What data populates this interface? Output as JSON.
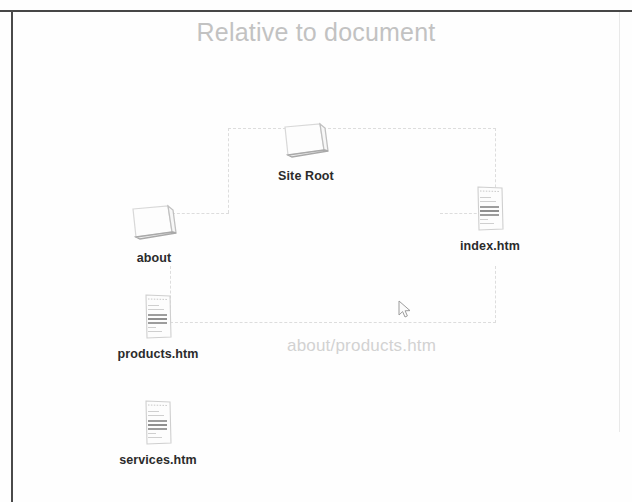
{
  "page": {
    "title": "Relative to document",
    "title_color": "#c2c2c2",
    "background": "#fefefe",
    "connector_color": "#dddddd",
    "label_color": "#2b2b2b"
  },
  "diagram": {
    "type": "site-tree",
    "ghost_path_label": "about/products.htm",
    "nodes": [
      {
        "id": "site-root",
        "label": "Site Root",
        "icon": "folder-icon",
        "x": 246,
        "y": 106
      },
      {
        "id": "about",
        "label": "about",
        "icon": "folder-icon",
        "x": 94,
        "y": 188
      },
      {
        "id": "index-htm",
        "label": "index.htm",
        "icon": "document-icon",
        "x": 430,
        "y": 176
      },
      {
        "id": "products-htm",
        "label": "products.htm",
        "icon": "document-icon",
        "x": 98,
        "y": 284
      },
      {
        "id": "services-htm",
        "label": "services.htm",
        "icon": "document-icon",
        "x": 98,
        "y": 390
      }
    ],
    "connectors": [
      {
        "id": "root-top-rail",
        "orient": "h",
        "x": 228,
        "y": 128,
        "len": 268
      },
      {
        "id": "about-riser",
        "orient": "v",
        "x": 228,
        "y": 128,
        "len": 85
      },
      {
        "id": "about-stub",
        "orient": "h",
        "x": 172,
        "y": 213,
        "len": 57
      },
      {
        "id": "index-riser",
        "orient": "v",
        "x": 495,
        "y": 128,
        "len": 85
      },
      {
        "id": "index-stub",
        "orient": "h",
        "x": 440,
        "y": 213,
        "len": 56
      },
      {
        "id": "index-drop",
        "orient": "v",
        "x": 495,
        "y": 266,
        "len": 57
      },
      {
        "id": "products-rail",
        "orient": "h",
        "x": 170,
        "y": 322,
        "len": 326
      },
      {
        "id": "products-riser",
        "orient": "v",
        "x": 170,
        "y": 266,
        "len": 57
      }
    ]
  },
  "cursor": {
    "name": "mouse-pointer",
    "x": 398,
    "y": 300
  }
}
